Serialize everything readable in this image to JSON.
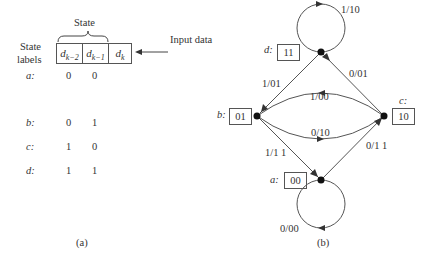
{
  "part_a": {
    "state_header": "State",
    "state_labels_header": [
      "State",
      "labels"
    ],
    "register_cells": [
      "d",
      "k−2",
      "d",
      "k−1",
      "d",
      "k"
    ],
    "input_label": "Input data",
    "rows": [
      {
        "label": "a:",
        "v1": "0",
        "v2": "0"
      },
      {
        "label": "b:",
        "v1": "0",
        "v2": "1"
      },
      {
        "label": "c:",
        "v1": "1",
        "v2": "0"
      },
      {
        "label": "d:",
        "v1": "1",
        "v2": "1"
      }
    ],
    "caption": "(a)"
  },
  "part_b": {
    "nodes": [
      {
        "name": "a",
        "label": "a:",
        "state": "00"
      },
      {
        "name": "b",
        "label": "b:",
        "state": "01"
      },
      {
        "name": "c",
        "label": "c:",
        "state": "10"
      },
      {
        "name": "d",
        "label": "d:",
        "state": "11"
      }
    ],
    "edges": [
      {
        "from": "d",
        "to": "d",
        "label": "1/10"
      },
      {
        "from": "d",
        "to": "b",
        "label": "1/01"
      },
      {
        "from": "c",
        "to": "d",
        "label": "0/01"
      },
      {
        "from": "c",
        "to": "b",
        "label": "1/00"
      },
      {
        "from": "b",
        "to": "c",
        "label": "0/10"
      },
      {
        "from": "b",
        "to": "a",
        "label": "1/1 1"
      },
      {
        "from": "a",
        "to": "c",
        "label": "0/1 1"
      },
      {
        "from": "a",
        "to": "a",
        "label": "0/00"
      }
    ],
    "caption": "(b)"
  }
}
